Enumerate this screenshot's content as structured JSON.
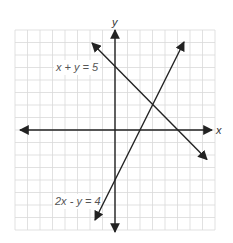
{
  "figure": {
    "axes": {
      "x_label": "x",
      "y_label": "y",
      "range": {
        "xmin": -8,
        "xmax": 8,
        "ymin": -8,
        "ymax": 8
      },
      "grid": true,
      "grid_step": 1
    },
    "lines": [
      {
        "equation": "x + y = 5",
        "label": "x + y = 5",
        "from": [
          -1.84,
          6.96
        ],
        "to": [
          7.36,
          -2.36
        ],
        "color": "#222222"
      },
      {
        "equation": "2x - y = 4",
        "label": "2x - y = 4",
        "from": [
          -1.6,
          -7.2
        ],
        "to": [
          5.52,
          7.04
        ],
        "color": "#222222"
      }
    ],
    "intersection": [
      3,
      2
    ],
    "colors": {
      "grid": "#d9d9d9",
      "axis": "#222222",
      "label": "#555555"
    }
  }
}
